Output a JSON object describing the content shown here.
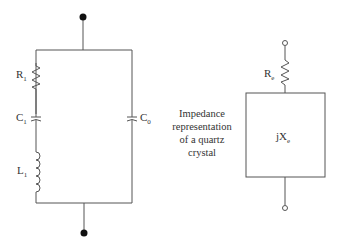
{
  "diagram": {
    "type": "circuit",
    "left_circuit": {
      "components": [
        {
          "id": "R1",
          "kind": "resistor",
          "label": "R",
          "sub": "1"
        },
        {
          "id": "C1",
          "kind": "capacitor",
          "label": "C",
          "sub": "1"
        },
        {
          "id": "L1",
          "kind": "inductor",
          "label": "L",
          "sub": "1"
        },
        {
          "id": "C0",
          "kind": "capacitor",
          "label": "C",
          "sub": "0"
        }
      ],
      "terminals": [
        "top",
        "bottom"
      ]
    },
    "right_circuit": {
      "components": [
        {
          "id": "Re",
          "kind": "resistor",
          "label": "R",
          "sub": "e"
        },
        {
          "id": "Xe",
          "kind": "impedance-box",
          "label": "jX",
          "sub": "e"
        }
      ],
      "caption": [
        "Impedance",
        "representation",
        "of a quartz",
        "crystal"
      ]
    },
    "colors": {
      "line": "#555555",
      "text": "#333333"
    }
  }
}
